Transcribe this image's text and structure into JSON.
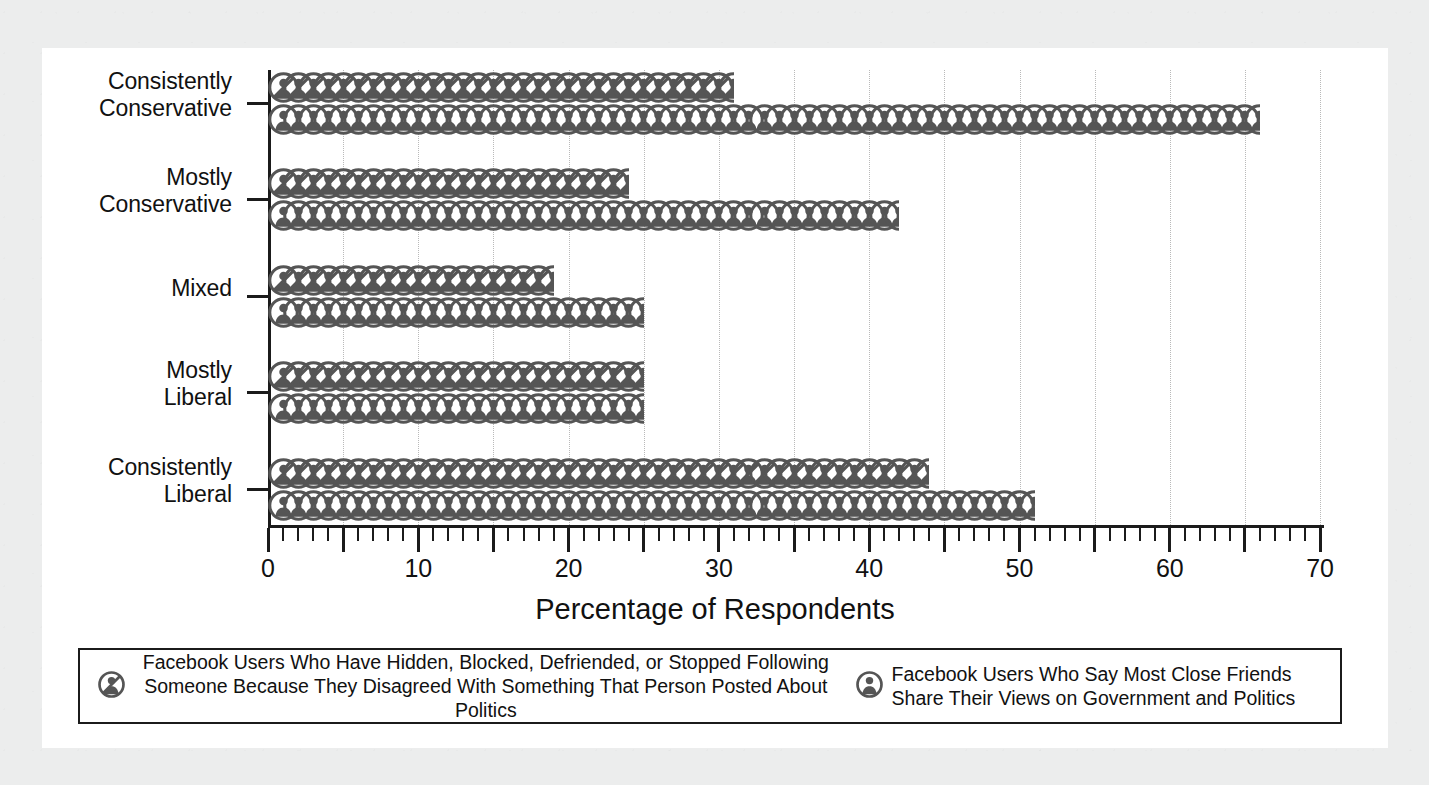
{
  "chart_data": {
    "type": "bar",
    "title": "",
    "xlabel": "Percentage of Respondents",
    "ylabel": "",
    "xlim": [
      0,
      70
    ],
    "xticks": [
      0,
      10,
      20,
      30,
      40,
      50,
      60,
      70
    ],
    "xtick_labels": [
      "0",
      "10",
      "20",
      "30",
      "40",
      "50",
      "60",
      "70"
    ],
    "grid": "dotted vertical gridlines every 5 units",
    "legend_position": "bottom",
    "icon_unit": "1 icon = 1 percentage point (pictogram / isotype chart)",
    "categories": [
      "Consistently Conservative",
      "Mostly Conservative",
      "Mixed",
      "Mostly Liberal",
      "Consistently Liberal"
    ],
    "series": [
      {
        "name": "Facebook Users Who Have Hidden, Blocked, Defriended, or Stopped Following Someone Because They Disagreed With Something That Person Posted About Politics",
        "icon": "person-blocked-icon",
        "values": [
          31,
          24,
          19,
          25,
          44
        ]
      },
      {
        "name": "Facebook Users Who Say Most Close Friends Share Their Views on Government and Politics",
        "icon": "person-icon",
        "values": [
          66,
          42,
          25,
          25,
          51
        ]
      }
    ]
  },
  "axis": {
    "x_title": "Percentage of Respondents",
    "tick_labels": [
      "0",
      "10",
      "20",
      "30",
      "40",
      "50",
      "60",
      "70"
    ],
    "category_labels": [
      {
        "line1": "Consistently",
        "line2": "Conservative"
      },
      {
        "line1": "Mostly",
        "line2": "Conservative"
      },
      {
        "line1": "Mixed",
        "line2": ""
      },
      {
        "line1": "Mostly",
        "line2": "Liberal"
      },
      {
        "line1": "Consistently",
        "line2": "Liberal"
      }
    ]
  },
  "legend": {
    "entries": [
      {
        "icon": "person-blocked-icon",
        "line1": "Facebook Users Who Have Hidden, Blocked, Defriended, or Stopped Following",
        "line2": "Someone Because They Disagreed With Something That Person Posted About Politics"
      },
      {
        "icon": "person-icon",
        "line1": "Facebook Users Who Say Most Close Friends",
        "line2": "Share Their Views on Government and Politics"
      }
    ]
  },
  "colors": {
    "page_background": "#eceded",
    "panel_background": "#ffffff",
    "ink": "#1b1b1b",
    "icon_fill": "#555555",
    "gridline": "#b9b9b9"
  }
}
